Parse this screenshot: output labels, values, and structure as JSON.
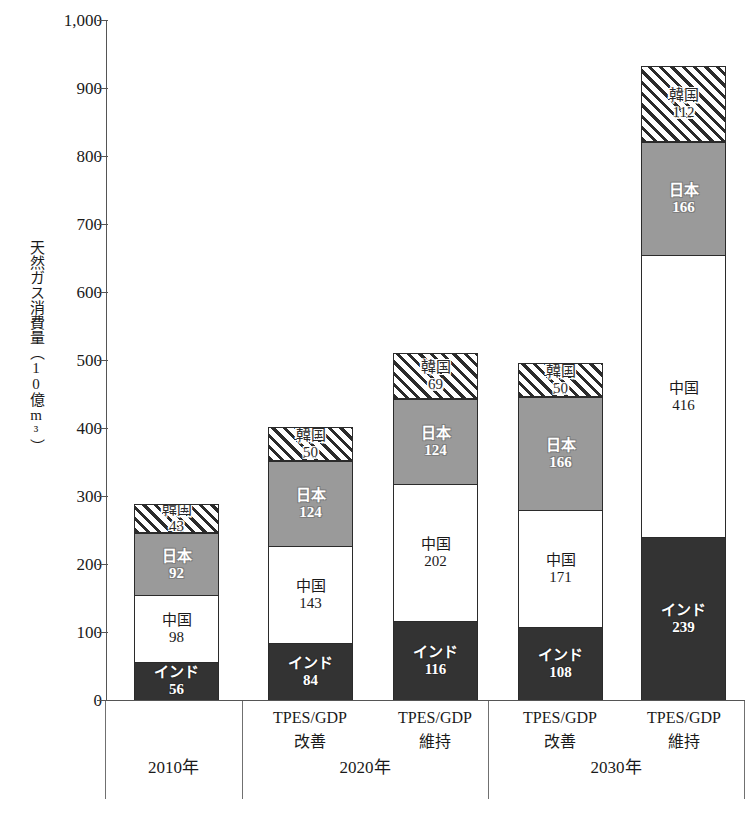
{
  "chart_data": {
    "type": "bar",
    "subtype": "stacked-bar",
    "title": "",
    "xlabel": "",
    "ylabel": "天然ガス消費量（10億m³）",
    "ylabel_vertical": "天然ガス消費量（10億m³）",
    "ylim": [
      0,
      1000
    ],
    "ytick_labels": [
      "1,000",
      "900",
      "800",
      "700",
      "600",
      "500",
      "400",
      "300",
      "200",
      "100",
      "0"
    ],
    "ytick_values": [
      1000,
      900,
      800,
      700,
      600,
      500,
      400,
      300,
      200,
      100,
      0
    ],
    "grid": false,
    "legend": "none (in-bar labels)",
    "categories": [
      "2010年",
      "2020年 TPES/GDP改善",
      "2020年 TPES/GDP維持",
      "2030年 TPES/GDP改善",
      "2030年 TPES/GDP維持"
    ],
    "series": [
      {
        "name": "インド",
        "color": "#333333",
        "pattern": "solid-dark",
        "values": [
          56,
          84,
          116,
          108,
          239
        ]
      },
      {
        "name": "中国",
        "color": "#ffffff",
        "pattern": "solid-white",
        "values": [
          98,
          143,
          202,
          171,
          416
        ]
      },
      {
        "name": "日本",
        "color": "#9a9a9a",
        "pattern": "solid-gray",
        "values": [
          92,
          124,
          124,
          166,
          166
        ]
      },
      {
        "name": "韓国",
        "color": "#ffffff",
        "pattern": "diagonal-hatch",
        "values": [
          43,
          50,
          69,
          50,
          112
        ]
      }
    ],
    "totals": [
      289,
      401,
      511,
      495,
      933
    ]
  },
  "axis": {
    "y_label_text": "天然ガス消費量（10億m³）",
    "ticks": [
      {
        "label": "1,000",
        "value": 1000
      },
      {
        "label": "900",
        "value": 900
      },
      {
        "label": "800",
        "value": 800
      },
      {
        "label": "700",
        "value": 700
      },
      {
        "label": "600",
        "value": 600
      },
      {
        "label": "500",
        "value": 500
      },
      {
        "label": "400",
        "value": 400
      },
      {
        "label": "300",
        "value": 300
      },
      {
        "label": "200",
        "value": 200
      },
      {
        "label": "100",
        "value": 100
      },
      {
        "label": "0",
        "value": 0
      }
    ]
  },
  "bars": [
    {
      "id": "bar-2010",
      "segments": [
        {
          "key": "india",
          "name": "インド",
          "value": "56"
        },
        {
          "key": "china",
          "name": "中国",
          "value": "98"
        },
        {
          "key": "japan",
          "name": "日本",
          "value": "92"
        },
        {
          "key": "korea",
          "name": "韓国",
          "value": "43"
        }
      ]
    },
    {
      "id": "bar-2020-improve",
      "segments": [
        {
          "key": "india",
          "name": "インド",
          "value": "84"
        },
        {
          "key": "china",
          "name": "中国",
          "value": "143"
        },
        {
          "key": "japan",
          "name": "日本",
          "value": "124"
        },
        {
          "key": "korea",
          "name": "韓国",
          "value": "50"
        }
      ]
    },
    {
      "id": "bar-2020-maintain",
      "segments": [
        {
          "key": "india",
          "name": "インド",
          "value": "116"
        },
        {
          "key": "china",
          "name": "中国",
          "value": "202"
        },
        {
          "key": "japan",
          "name": "日本",
          "value": "124"
        },
        {
          "key": "korea",
          "name": "韓国",
          "value": "69"
        }
      ]
    },
    {
      "id": "bar-2030-improve",
      "segments": [
        {
          "key": "india",
          "name": "インド",
          "value": "108"
        },
        {
          "key": "china",
          "name": "中国",
          "value": "171"
        },
        {
          "key": "japan",
          "name": "日本",
          "value": "166"
        },
        {
          "key": "korea",
          "name": "韓国",
          "value": "50"
        }
      ]
    },
    {
      "id": "bar-2030-maintain",
      "segments": [
        {
          "key": "india",
          "name": "インド",
          "value": "239"
        },
        {
          "key": "china",
          "name": "中国",
          "value": "416"
        },
        {
          "key": "japan",
          "name": "日本",
          "value": "166"
        },
        {
          "key": "korea",
          "name": "韓国",
          "value": "112"
        }
      ]
    }
  ],
  "xaxis": {
    "sub_labels": [
      {
        "line1": "TPES/GDP",
        "line2": "改善"
      },
      {
        "line1": "TPES/GDP",
        "line2": "維持"
      },
      {
        "line1": "TPES/GDP",
        "line2": "改善"
      },
      {
        "line1": "TPES/GDP",
        "line2": "維持"
      }
    ],
    "groups": [
      {
        "label": "2010年"
      },
      {
        "label": "2020年"
      },
      {
        "label": "2030年"
      }
    ]
  }
}
